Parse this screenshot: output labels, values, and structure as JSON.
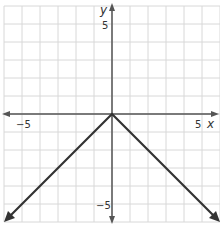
{
  "chart_data": {
    "type": "line",
    "title": "",
    "xlabel": "x",
    "ylabel": "y",
    "xlim": [
      -6,
      6
    ],
    "ylim": [
      -6,
      6
    ],
    "grid": true,
    "x_ticks_labeled": [
      -5,
      5
    ],
    "y_ticks_labeled": [
      5,
      -5
    ],
    "series": [
      {
        "name": "y = -|x|",
        "x": [
          -6,
          0,
          6
        ],
        "y": [
          -6,
          0,
          6
        ],
        "points": [
          [
            -6,
            -6
          ],
          [
            0,
            0
          ],
          [
            6,
            -6
          ]
        ],
        "arrows_at_ends": true
      }
    ]
  },
  "labels": {
    "x_axis": "x",
    "y_axis": "y",
    "x_neg": "−5",
    "x_pos": "5",
    "y_pos": "5",
    "y_neg": "−5"
  },
  "colors": {
    "grid": "#d8d8d8",
    "axis": "#555555",
    "line": "#333333"
  }
}
